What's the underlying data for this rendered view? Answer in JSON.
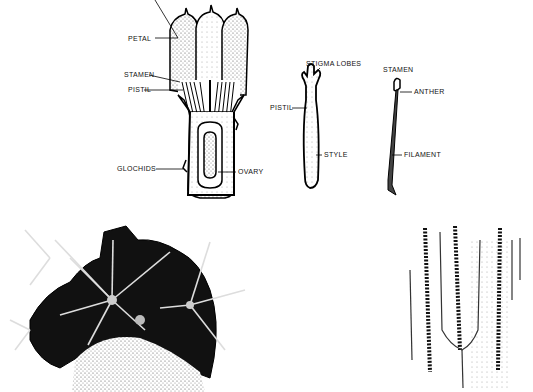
{
  "figures": {
    "flower_section": {
      "labels": {
        "petal": "PETAL",
        "stamen": "STAMEN",
        "pistil": "PISTIL",
        "glochids": "GLOCHIDS",
        "ovary": "OVARY"
      }
    },
    "pistil_detail": {
      "labels": {
        "stigma_lobes": "STIGMA LOBES",
        "pistil": "PISTIL",
        "style": "STYLE"
      }
    },
    "stamen_detail": {
      "labels": {
        "stamen": "STAMEN",
        "anther": "ANTHER",
        "filament": "FILAMENT"
      }
    },
    "cactus_top": {},
    "cactus_ribs": {}
  }
}
